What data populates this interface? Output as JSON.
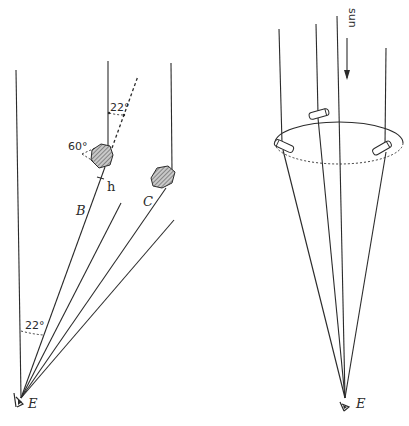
{
  "left_diagram": {
    "labels": {
      "top_angle": "22°",
      "crystal_angle": "60°",
      "height_label": "h",
      "ray_b": "B",
      "ray_c": "C",
      "bottom_angle": "22°",
      "eye": "E"
    }
  },
  "right_diagram": {
    "labels": {
      "sun": "sun",
      "eye": "E"
    }
  },
  "colors": {
    "ink": "#2b2b2b",
    "crystal_fill": "#8a8a8a",
    "background": "#ffffff"
  }
}
